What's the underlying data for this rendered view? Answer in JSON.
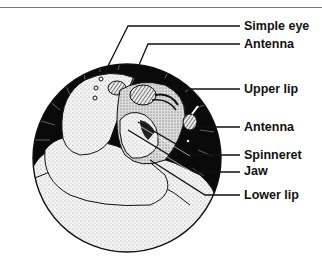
{
  "figure": {
    "colors": {
      "background": "#ffffff",
      "ink": "#111111",
      "circle_fill": "#0a0a0a",
      "body_fill": "#f2f2f2",
      "stipple": "#9a9a9a",
      "rule": "#777777"
    },
    "labels": [
      {
        "id": "simple-eye",
        "text": "Simple eye",
        "y": 22
      },
      {
        "id": "antenna-top",
        "text": "Antenna",
        "y": 41
      },
      {
        "id": "upper-lip",
        "text": "Upper lip",
        "y": 84
      },
      {
        "id": "antenna-right",
        "text": "Antenna",
        "y": 122
      },
      {
        "id": "spinneret",
        "text": "Spinneret",
        "y": 151
      },
      {
        "id": "jaw",
        "text": "Jaw",
        "y": 167
      },
      {
        "id": "lower-lip",
        "text": "Lower lip",
        "y": 190
      }
    ]
  }
}
